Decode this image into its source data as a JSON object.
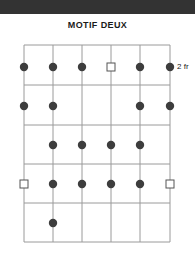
{
  "figure": {
    "title": "MOTIF DEUX",
    "fret_label": "2 fr",
    "colors": {
      "band": "#333333",
      "grid_line": "#9a9a9a",
      "grid_border": "#8c8c8c",
      "marker_filled": "#3d3d3d",
      "marker_open_stroke": "#555555",
      "marker_open_fill": "#ffffff",
      "text": "#1a1a1a"
    }
  },
  "grid": {
    "columns": 6,
    "rows": 5,
    "left": 24,
    "top": 45,
    "right": 170,
    "bottom": 242,
    "column_x": [
      24,
      53,
      82,
      111,
      140,
      170
    ],
    "row_y": [
      67,
      106,
      145,
      184,
      223
    ],
    "row_line_y": [
      45,
      85,
      125,
      164,
      203,
      242
    ]
  },
  "chart_data": {
    "type": "scatter",
    "title": "MOTIF DEUX",
    "xlabel": "",
    "ylabel": "",
    "legend": [
      "filled = fingered note",
      "open square = root/optional note"
    ],
    "annotations": [
      {
        "text": "2 fr",
        "at_row": 1,
        "at_column": 6,
        "position": "right-of-grid"
      }
    ],
    "markers": [
      {
        "row": 1,
        "column": 1,
        "type": "filled"
      },
      {
        "row": 1,
        "column": 2,
        "type": "filled"
      },
      {
        "row": 1,
        "column": 3,
        "type": "filled"
      },
      {
        "row": 1,
        "column": 4,
        "type": "open-square"
      },
      {
        "row": 1,
        "column": 5,
        "type": "filled"
      },
      {
        "row": 1,
        "column": 6,
        "type": "filled"
      },
      {
        "row": 2,
        "column": 1,
        "type": "filled"
      },
      {
        "row": 2,
        "column": 2,
        "type": "filled"
      },
      {
        "row": 2,
        "column": 5,
        "type": "filled"
      },
      {
        "row": 2,
        "column": 6,
        "type": "filled"
      },
      {
        "row": 3,
        "column": 2,
        "type": "filled"
      },
      {
        "row": 3,
        "column": 3,
        "type": "filled"
      },
      {
        "row": 3,
        "column": 4,
        "type": "filled"
      },
      {
        "row": 3,
        "column": 5,
        "type": "filled"
      },
      {
        "row": 4,
        "column": 1,
        "type": "open-square"
      },
      {
        "row": 4,
        "column": 2,
        "type": "filled"
      },
      {
        "row": 4,
        "column": 3,
        "type": "filled"
      },
      {
        "row": 4,
        "column": 4,
        "type": "filled"
      },
      {
        "row": 4,
        "column": 5,
        "type": "filled"
      },
      {
        "row": 4,
        "column": 6,
        "type": "open-square"
      },
      {
        "row": 5,
        "column": 2,
        "type": "filled"
      }
    ]
  }
}
